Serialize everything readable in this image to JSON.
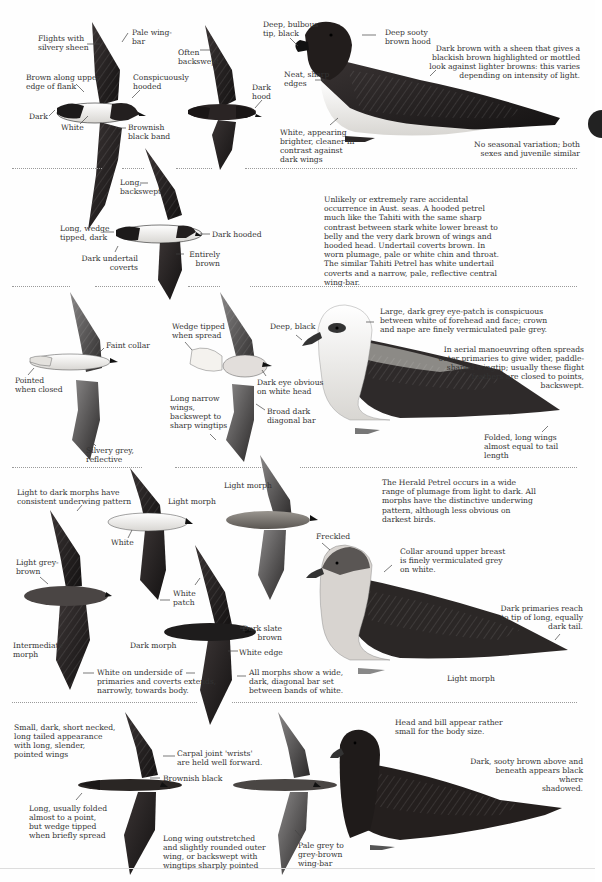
{
  "colors": {
    "ink_dark": "#1e1c1c",
    "ink_brown": "#2c2624",
    "ink_grey": "#6a6a6a",
    "pale": "#f4f2ee",
    "text": "#333333",
    "divider": "#9a9a9a",
    "thumb_tab": "#222222"
  },
  "sections": [
    {
      "id": "hooded-petrel",
      "flight_labels": {
        "flights_silvery": "Flights with\nsilvery sheen",
        "pale_wing_bar": "Pale wing-\nbar",
        "brown_upper_flank": "Brown along upper\nedge of flank",
        "conspicuously_hooded": "Conspicuously\nhooded",
        "dark": "Dark",
        "white": "White",
        "brownish_black_band": "Brownish\nblack band",
        "often_backswept": "Often\nbackswept",
        "dark_hood": "Dark\nhood"
      },
      "perched_labels": {
        "bill": "Deep, bulbous\ntip, black",
        "hood": "Deep sooty\nbrown hood",
        "edges": "Neat, sharp\nedges",
        "white_belly": "White, appearing\nbrighter, cleaner in\ncontrast against\ndark wings",
        "sheen": "Dark brown with a sheen that gives a\nblackish brown highlighted or mottled\nlook against lighter browns: this varies\ndepending on intensity of light.",
        "seasonal": "No seasonal variation; both\nsexes and juvenile similar"
      }
    },
    {
      "id": "beck-petrel",
      "flight_labels": {
        "long_backswept": "Long,\nbackswept",
        "wedge_tipped": "Long, wedge\ntipped, dark",
        "dark_hooded": "Dark hooded",
        "dark_undertail": "Dark undertail\ncoverts",
        "entirely_brown": "Entirely\nbrown"
      },
      "description": "Unlikely or extremely rare accidental occurrence in Aust. seas.  A hooded petrel much like the Tahiti with the same sharp contrast between stark white lower breast to belly and the very dark brown of wings and hooded head.  Undertail coverts brown. In worn plumage, pale or white chin and throat. The similar Tahiti Petrel has white undertail coverts and a narrow, pale, reflective central wing-bar."
    },
    {
      "id": "white-headed-petrel",
      "flight_labels": {
        "faint_collar": "Faint collar",
        "pointed_closed": "Pointed\nwhen closed",
        "silvery_grey": "Silvery grey,\nreflective",
        "wedge_spread": "Wedge tipped\nwhen spread",
        "long_narrow": "Long narrow\nwings,\nbackswept to\nsharp wingtips",
        "dark_eye": "Dark eye obvious\non white head",
        "broad_bar": "Broad dark\ndiagonal bar"
      },
      "perched_labels": {
        "bill": "Deep, black",
        "eye_patch": "Large, dark grey eye-patch is conspicuous\nbetween white of forehead and face; crown\nand nape are finely vermiculated pale grey.",
        "manoeuvring": "In aerial manoeuvring often spreads\nouter primaries to give wider, paddle-\nshaped wingtip; usually these flight\nfeathers are closed to points,\nbackswept.",
        "folded": "Folded, long wings\nalmost equal to tail\nlength"
      }
    },
    {
      "id": "herald-petrel",
      "flight_labels": {
        "consistent": "Light to dark morphs have\nconsistent underwing pattern",
        "light_morph_a": "Light morph",
        "light_morph_b": "Light morph",
        "white_a": "White",
        "light_grey_brown": "Light grey-\nbrown",
        "white_patch": "White\npatch",
        "intermediate": "Intermediate\nmorph",
        "dark_morph": "Dark morph",
        "dark_slate": "Dark slate\nbrown",
        "white_edge": "White edge",
        "white_underside": "White on underside of\nprimaries and coverts extends,\nnarrowly, towards body.",
        "all_morphs": "All morphs show a wide,\ndark, diagonal bar set\nbetween bands of white."
      },
      "description": "The Herald Petrel occurs in a wide range of plumage from light to dark.  All morphs have the distinctive underwing pattern, although less obvious on darkest birds.",
      "perched_labels": {
        "freckled": "Freckled",
        "collar": "Collar around upper breast\nis finely vermiculated grey\non white.",
        "primaries": "Dark primaries reach\nto tip of long, equally\ndark tail.",
        "light_morph": "Light morph"
      }
    },
    {
      "id": "bulwer-petrel",
      "flight_labels": {
        "small_dark": "Small, dark, short necked,\nlong tailed appearance\nwith long, slender,\npointed wings",
        "carpal": "Carpal joint 'wrists'\nare held well forward.",
        "brownish_black": "Brownish black",
        "long_folded": "Long, usually folded\nalmost to a point,\nbut wedge tipped\nwhen briefly spread",
        "long_wing": "Long wing outstretched\nand slightly rounded outer\nwing, or backswept with\nwingtips sharply pointed",
        "pale_grey_bar": "Pale grey to\ngrey-brown\nwing-bar"
      },
      "perched_labels": {
        "head_bill": "Head and bill appear rather\nsmall for the body size.",
        "sooty": "Dark, sooty brown above and\nbeneath appears black where\nshadowed."
      }
    }
  ],
  "icons": {
    "thumb_tab": "section-tab-marker"
  }
}
